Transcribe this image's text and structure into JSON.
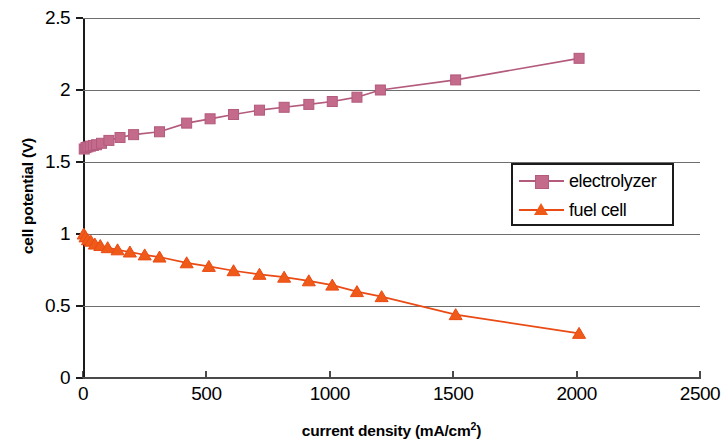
{
  "chart_data": {
    "type": "line",
    "title": "",
    "xlabel": "current density (mA/cm2)",
    "xlabel_base": "current density (mA/cm",
    "xlabel_sup": "2",
    "xlabel_tail": ")",
    "ylabel": "cell potential (V)",
    "xlim": [
      0,
      2500
    ],
    "ylim": [
      0,
      2.5
    ],
    "xticks": [
      0,
      500,
      1000,
      1500,
      2000,
      2500
    ],
    "xtick_labels": [
      "0",
      "500",
      "1000",
      "1500",
      "2000",
      "2500"
    ],
    "yticks": [
      0,
      0.5,
      1,
      1.5,
      2,
      2.5
    ],
    "ytick_labels": [
      "0",
      "0.5",
      "1",
      "1.5",
      "2",
      "2.5"
    ],
    "grid": "horizontal",
    "legend_position": "center-right",
    "series": [
      {
        "name": "electrolyzer",
        "color": "#b35a7d",
        "marker": "square",
        "marker_color": "#c46b8c",
        "x": [
          5,
          12,
          20,
          30,
          42,
          55,
          75,
          105,
          150,
          205,
          310,
          420,
          515,
          610,
          715,
          815,
          915,
          1010,
          1110,
          1205,
          1510,
          2010
        ],
        "y": [
          1.59,
          1.6,
          1.605,
          1.61,
          1.615,
          1.62,
          1.63,
          1.65,
          1.67,
          1.69,
          1.71,
          1.77,
          1.8,
          1.83,
          1.86,
          1.88,
          1.9,
          1.92,
          1.95,
          2.0,
          2.07,
          2.22
        ]
      },
      {
        "name": "fuel cell",
        "color": "#ea4a13",
        "marker": "triangle",
        "marker_color": "#ef5a19",
        "x": [
          3,
          10,
          20,
          32,
          48,
          70,
          100,
          140,
          190,
          250,
          310,
          420,
          510,
          610,
          715,
          815,
          915,
          1010,
          1110,
          1210,
          1510,
          2010
        ],
        "y": [
          1.0,
          0.98,
          0.96,
          0.95,
          0.93,
          0.92,
          0.905,
          0.89,
          0.875,
          0.855,
          0.84,
          0.8,
          0.775,
          0.745,
          0.72,
          0.7,
          0.675,
          0.645,
          0.6,
          0.565,
          0.44,
          0.31
        ]
      }
    ]
  },
  "legend": {
    "items": [
      {
        "label": "electrolyzer",
        "color": "#b35a7d",
        "marker": "square"
      },
      {
        "label": "fuel cell",
        "color": "#ea4a13",
        "marker": "triangle"
      }
    ]
  }
}
